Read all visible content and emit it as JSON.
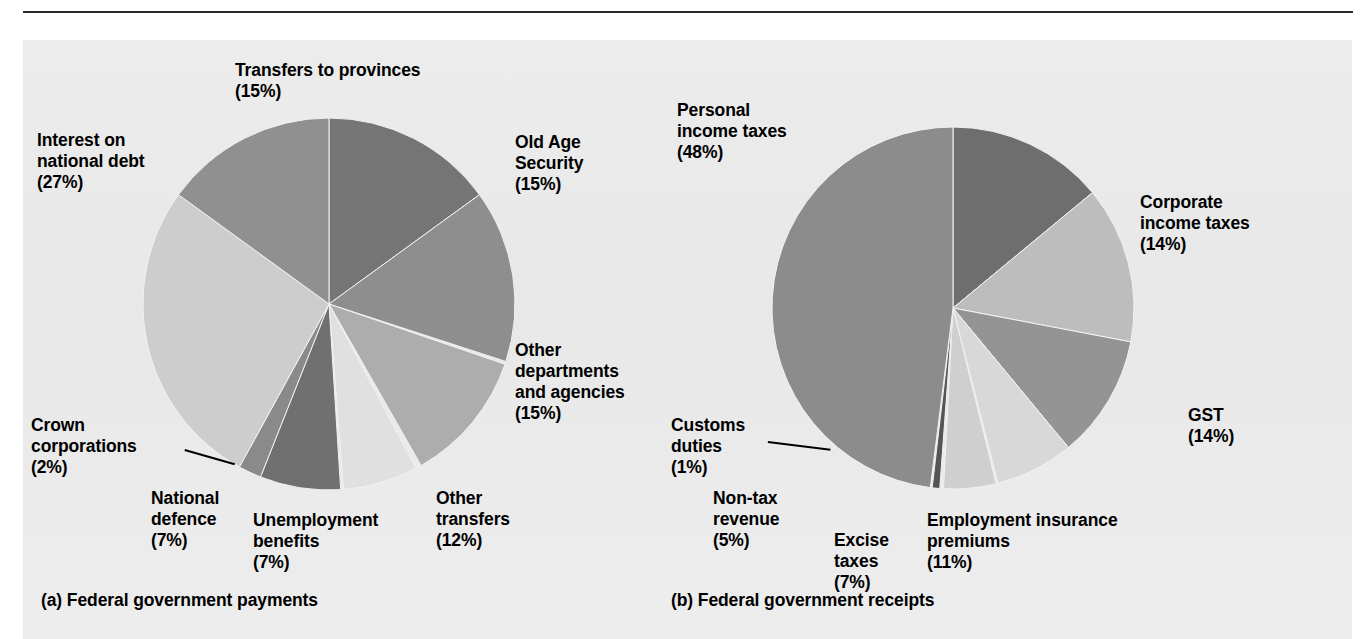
{
  "figure": {
    "background_color": "#eaeaea",
    "page_color": "#ffffff",
    "rule_color": "#2b2b2b"
  },
  "chart_data": [
    {
      "type": "pie",
      "id": "federal-government-payments",
      "title": "(a) Federal government payments",
      "caption": "(a) Federal government payments",
      "start_angle_deg": 0,
      "direction": "clockwise",
      "total_percent": 100,
      "categories": [
        "Old Age Security",
        "Other departments and agencies",
        "Other transfers",
        "Unemployment benefits",
        "National defence",
        "Crown corporations",
        "Interest on national debt",
        "Transfers to provinces"
      ],
      "values": [
        15,
        15,
        12,
        7,
        7,
        2,
        27,
        15
      ],
      "colors": [
        "#757575",
        "#8e8e8e",
        "#adadad",
        "#e0e0e0",
        "#707070",
        "#8a8a8a",
        "#cdcdcd",
        "#909090"
      ],
      "slices": [
        {
          "label": "Old Age Security",
          "value": 15,
          "value_text": "(15%)",
          "color": "#757575"
        },
        {
          "label": "Other departments and agencies",
          "value": 15,
          "value_text": "(15%)",
          "color": "#8e8e8e"
        },
        {
          "label": "Other transfers",
          "value": 12,
          "value_text": "(12%)",
          "color": "#adadad"
        },
        {
          "label": "Unemployment benefits",
          "value": 7,
          "value_text": "(7%)",
          "color": "#e0e0e0"
        },
        {
          "label": "National defence",
          "value": 7,
          "value_text": "(7%)",
          "color": "#707070"
        },
        {
          "label": "Crown corporations",
          "value": 2,
          "value_text": "(2%)",
          "color": "#8a8a8a"
        },
        {
          "label": "Interest on national debt",
          "value": 27,
          "value_text": "(27%)",
          "color": "#cdcdcd"
        },
        {
          "label": "Transfers to provinces",
          "value": 15,
          "value_text": "(15%)",
          "color": "#909090"
        }
      ],
      "labels": {
        "transfers_to_provinces": "Transfers to provinces\n(15%)",
        "old_age_security": "Old Age\nSecurity\n(15%)",
        "interest_on_national_debt": "Interest on\nnational debt\n(27%)",
        "other_departments": "Other\ndepartments\nand agencies\n(15%)",
        "crown_corporations": "Crown\ncorporations\n(2%)",
        "national_defence": "National\ndefence\n(7%)",
        "unemployment_benefits": "Unemployment\nbenefits\n(7%)",
        "other_transfers": "Other\ntransfers\n(12%)"
      },
      "legend": "none",
      "grid": false
    },
    {
      "type": "pie",
      "id": "federal-government-receipts",
      "title": "(b) Federal government receipts",
      "caption": "(b) Federal government receipts",
      "start_angle_deg": 0,
      "direction": "clockwise",
      "total_percent": 100,
      "categories": [
        "Corporate income taxes",
        "GST",
        "Employment insurance premiums",
        "Excise taxes",
        "Non-tax revenue",
        "Customs duties",
        "Personal income taxes"
      ],
      "values": [
        14,
        14,
        11,
        7,
        5,
        1,
        48
      ],
      "colors": [
        "#6e6e6e",
        "#bdbdbd",
        "#949494",
        "#d8d8d8",
        "#cfcfcf",
        "#555555",
        "#8c8c8c"
      ],
      "slices": [
        {
          "label": "Corporate income taxes",
          "value": 14,
          "value_text": "(14%)",
          "color": "#6e6e6e"
        },
        {
          "label": "GST",
          "value": 14,
          "value_text": "(14%)",
          "color": "#bdbdbd"
        },
        {
          "label": "Employment insurance premiums",
          "value": 11,
          "value_text": "(11%)",
          "color": "#949494"
        },
        {
          "label": "Excise taxes",
          "value": 7,
          "value_text": "(7%)",
          "color": "#d8d8d8"
        },
        {
          "label": "Non-tax revenue",
          "value": 5,
          "value_text": "(5%)",
          "color": "#cfcfcf"
        },
        {
          "label": "Customs duties",
          "value": 1,
          "value_text": "(1%)",
          "color": "#555555"
        },
        {
          "label": "Personal income taxes",
          "value": 48,
          "value_text": "(48%)",
          "color": "#8c8c8c"
        }
      ],
      "labels": {
        "personal_income_taxes": "Personal\nincome taxes\n(48%)",
        "corporate_income_taxes": "Corporate\nincome taxes\n(14%)",
        "gst": "GST\n(14%)",
        "employment_insurance_premiums": "Employment insurance\npremiums\n(11%)",
        "excise_taxes": "Excise\ntaxes\n(7%)",
        "non_tax_revenue": "Non-tax\nrevenue\n(5%)",
        "customs_duties": "Customs\nduties\n(1%)"
      },
      "legend": "none",
      "grid": false
    }
  ]
}
